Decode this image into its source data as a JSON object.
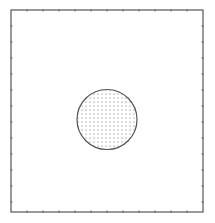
{
  "diagram": {
    "frame": {
      "x": 11,
      "y": 10,
      "width": 192,
      "height": 202,
      "stroke": "#555555",
      "tick_spacing": 16
    },
    "circle": {
      "cx": 107,
      "cy": 119.5,
      "r": 30,
      "stroke": "#555555",
      "fill_pattern": "dots",
      "dot_spacing": 4,
      "dot_color": "#666666"
    },
    "colors": {
      "background": "#ffffff",
      "line": "#555555"
    }
  }
}
